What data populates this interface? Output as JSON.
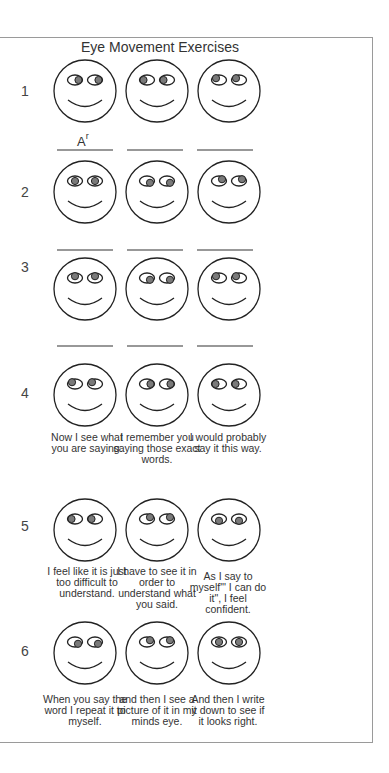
{
  "title": "Eye Movement Exercises",
  "line_label": {
    "base": "A",
    "superscript": "r"
  },
  "colors": {
    "outline": "#222222",
    "pupil": "#7a7a7a",
    "frame": "#9a9a9a"
  },
  "rows": [
    {
      "number": "1",
      "faces": [
        {
          "gaze": "right",
          "caption": ""
        },
        {
          "gaze": "left",
          "caption": ""
        },
        {
          "gaze": "up-left",
          "caption": ""
        }
      ]
    },
    {
      "number": "2",
      "faces": [
        {
          "gaze": "center",
          "caption": ""
        },
        {
          "gaze": "down-right",
          "caption": ""
        },
        {
          "gaze": "up-right",
          "caption": ""
        }
      ]
    },
    {
      "number": "3",
      "faces": [
        {
          "gaze": "up",
          "caption": ""
        },
        {
          "gaze": "down-right",
          "caption": ""
        },
        {
          "gaze": "up-left",
          "caption": ""
        }
      ]
    },
    {
      "number": "4",
      "faces": [
        {
          "gaze": "up-left",
          "caption": "Now I see what you are saying."
        },
        {
          "gaze": "right",
          "caption": "I remember you saying those exact words."
        },
        {
          "gaze": "left",
          "caption": "I would probably say it this way."
        }
      ]
    },
    {
      "number": "5",
      "faces": [
        {
          "gaze": "left",
          "caption": "I feel like it is just too difficult to understand."
        },
        {
          "gaze": "up-right",
          "caption": "I have to see it in order to understand what you said."
        },
        {
          "gaze": "down",
          "caption": "As I say to myself\"' I can do it\", I feel confident."
        }
      ]
    },
    {
      "number": "6",
      "faces": [
        {
          "gaze": "down-right",
          "caption": "When you say the word I repeat it to myself."
        },
        {
          "gaze": "up-right",
          "caption": "and then I see a picture of it in my minds eye."
        },
        {
          "gaze": "center",
          "caption": "And then I write it down to see if it looks right."
        }
      ]
    }
  ]
}
